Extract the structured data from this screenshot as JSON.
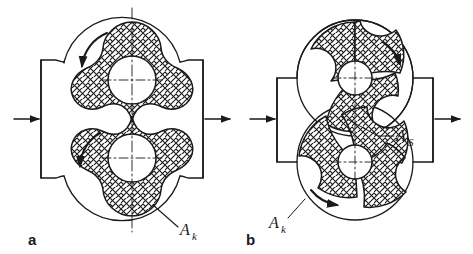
{
  "figure": {
    "background": "#ffffff",
    "line_color": "#1a1a1a",
    "centerline_color": "#1a1a1a",
    "type": "engineering-drawing"
  },
  "panel_a": {
    "caption": "a",
    "rotor_count": 2,
    "lobes_per_rotor": 3,
    "rotor_style": "three-lobe Roots-type",
    "hatch": "crosshatch",
    "inlet_arrow": "arrow-right",
    "outlet_arrow": "arrow-right",
    "rotation_arrows": 2,
    "rotation_direction": "counterclockwise",
    "callouts": [
      {
        "label": "A",
        "subscript": "k",
        "target": "housing-chamber-area"
      }
    ]
  },
  "panel_b": {
    "caption": "b",
    "rotor_count": 2,
    "lobes_per_rotor": 3,
    "rotor_style": "three-vane hooked profile",
    "hatch": "crosshatch",
    "inlet_arrow": "arrow-right",
    "outlet_arrow": "arrow-right",
    "rotation_arrows": 2,
    "rotation_direction": "clockwise",
    "callouts": [
      {
        "label": "A",
        "subscript": "S",
        "target": "gap-area"
      },
      {
        "label": "A",
        "subscript": "k",
        "target": "housing-chamber-area"
      }
    ]
  }
}
